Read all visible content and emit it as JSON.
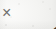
{
  "image": {
    "kind": "scanned-text-fragment",
    "width_px": 56,
    "height_px": 29,
    "background_color": "#f7f7f5",
    "ink_color": "#343434",
    "operator_ink_color": "#6f6f6c"
  },
  "expression": {
    "full_text": "× 1·4",
    "operator": "×",
    "operator_name": "multiplication-sign",
    "operand": {
      "text": "1·4",
      "integer_part": "1",
      "separator": "·",
      "separator_name": "middle-dot-decimal-separator",
      "fraction_part": "4",
      "value": 1.4
    }
  }
}
